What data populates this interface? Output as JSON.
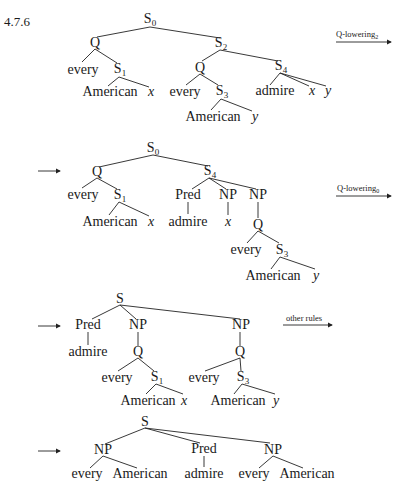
{
  "example_number": "4.7.6",
  "rules": {
    "rule1": {
      "label": "Q-lowering",
      "subscript": "2"
    },
    "rule2": {
      "label": "Q-lowering",
      "subscript": "0"
    },
    "rule3": {
      "label": "other rules",
      "subscript": ""
    }
  },
  "trees": [
    {
      "id": "tree-1",
      "nodes": {
        "root": {
          "cat": "S",
          "sub": "0"
        },
        "q1": {
          "cat": "Q"
        },
        "s2": {
          "cat": "S",
          "sub": "2"
        },
        "every1": {
          "word": "every"
        },
        "s1": {
          "cat": "S",
          "sub": "1"
        },
        "american1": {
          "word": "American"
        },
        "x1": {
          "word": "x"
        },
        "q2": {
          "cat": "Q"
        },
        "s4": {
          "cat": "S",
          "sub": "4"
        },
        "every2": {
          "word": "every"
        },
        "s3": {
          "cat": "S",
          "sub": "3"
        },
        "american2": {
          "word": "American"
        },
        "y1": {
          "word": "y"
        },
        "admire": {
          "word": "admire"
        },
        "x2": {
          "word": "x"
        },
        "y2": {
          "word": "y"
        }
      }
    },
    {
      "id": "tree-2",
      "nodes": {
        "root": {
          "cat": "S",
          "sub": "0"
        },
        "q1": {
          "cat": "Q"
        },
        "s4": {
          "cat": "S",
          "sub": "4"
        },
        "every1": {
          "word": "every"
        },
        "s1": {
          "cat": "S",
          "sub": "1"
        },
        "american1": {
          "word": "American"
        },
        "x1": {
          "word": "x"
        },
        "pred": {
          "cat": "Pred"
        },
        "np1": {
          "cat": "NP"
        },
        "np2": {
          "cat": "NP"
        },
        "admire": {
          "word": "admire"
        },
        "x2": {
          "word": "x"
        },
        "q2": {
          "cat": "Q"
        },
        "every2": {
          "word": "every"
        },
        "s3": {
          "cat": "S",
          "sub": "3"
        },
        "american2": {
          "word": "American"
        },
        "y1": {
          "word": "y"
        }
      }
    },
    {
      "id": "tree-3",
      "nodes": {
        "root": {
          "cat": "S"
        },
        "pred": {
          "cat": "Pred"
        },
        "np1": {
          "cat": "NP"
        },
        "np2": {
          "cat": "NP"
        },
        "admire": {
          "word": "admire"
        },
        "q1": {
          "cat": "Q"
        },
        "q2": {
          "cat": "Q"
        },
        "every1": {
          "word": "every"
        },
        "s1": {
          "cat": "S",
          "sub": "1"
        },
        "every2": {
          "word": "every"
        },
        "s3": {
          "cat": "S",
          "sub": "3"
        },
        "american1": {
          "word": "American"
        },
        "x1": {
          "word": "x"
        },
        "american2": {
          "word": "American"
        },
        "y1": {
          "word": "y"
        }
      }
    },
    {
      "id": "tree-4",
      "nodes": {
        "root": {
          "cat": "S"
        },
        "np1": {
          "cat": "NP"
        },
        "pred": {
          "cat": "Pred"
        },
        "np2": {
          "cat": "NP"
        },
        "every1": {
          "word": "every"
        },
        "american1": {
          "word": "American"
        },
        "admire": {
          "word": "admire"
        },
        "every2": {
          "word": "every"
        },
        "american2": {
          "word": "American"
        }
      }
    }
  ]
}
